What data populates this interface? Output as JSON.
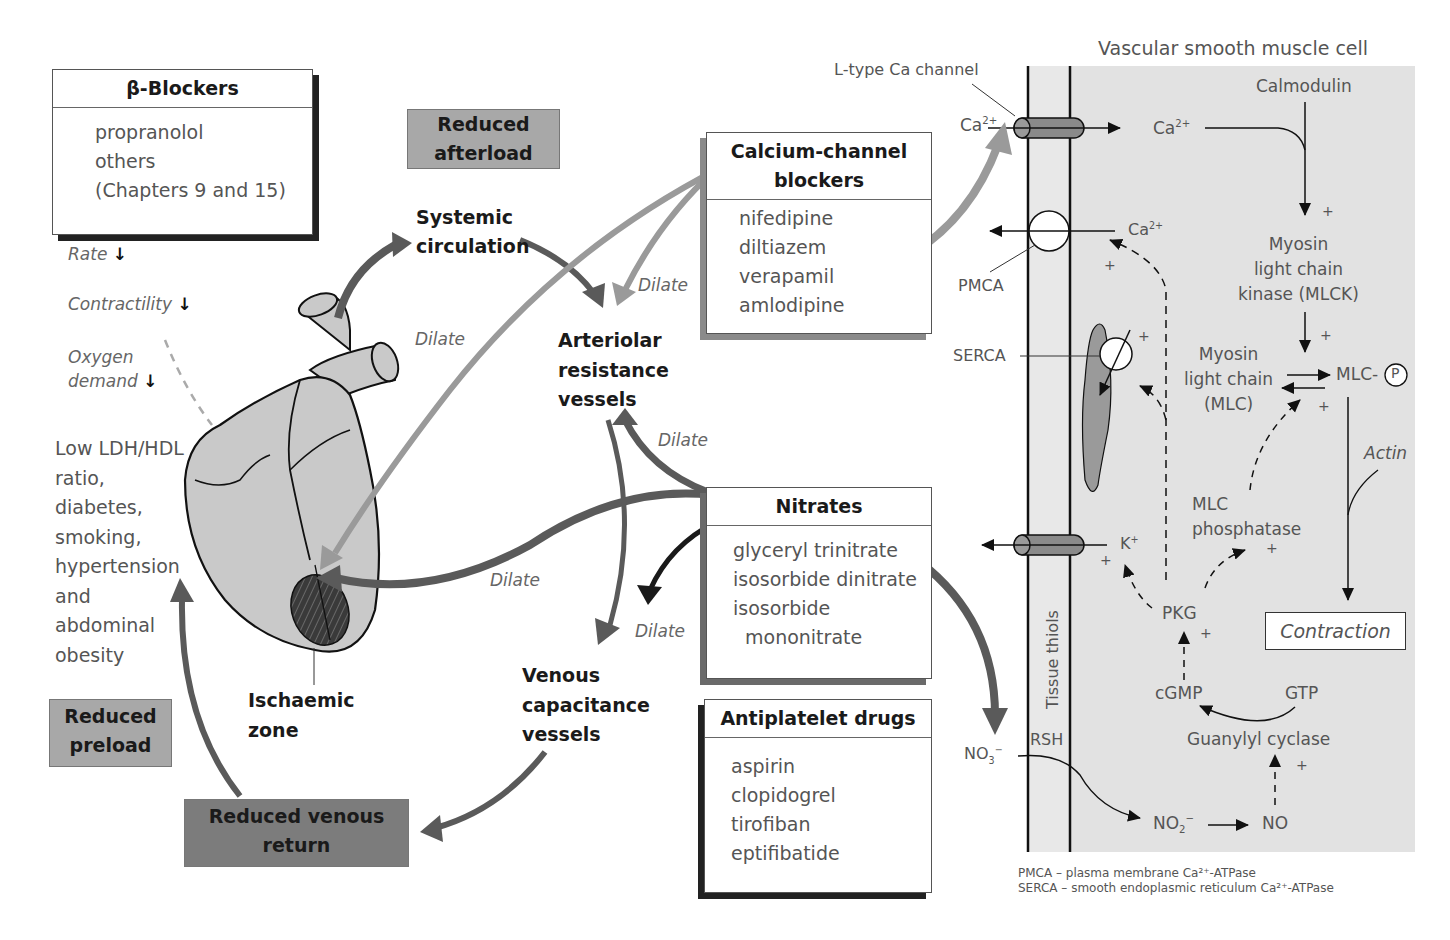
{
  "beta_blockers": {
    "title": "β-Blockers",
    "items": [
      "propranolol",
      "others",
      "(Chapters 9 and 15)"
    ],
    "effects": [
      {
        "label": "Rate",
        "arrow": "↓"
      },
      {
        "label": "Contractility",
        "arrow": "↓"
      },
      {
        "label_line1": "Oxygen",
        "label_line2": "demand",
        "arrow": "↓"
      }
    ]
  },
  "risk_factors": [
    "Low LDH/HDL",
    "ratio,",
    "diabetes,",
    "smoking,",
    "hypertension",
    "and",
    "abdominal",
    "obesity"
  ],
  "effect_boxes": {
    "reduced_afterload": [
      "Reduced",
      "afterload"
    ],
    "reduced_preload": [
      "Reduced",
      "preload"
    ],
    "reduced_venous_return": [
      "Reduced venous",
      "return"
    ]
  },
  "vessels": {
    "systemic_circulation": [
      "Systemic",
      "circulation"
    ],
    "arteriolar": [
      "Arteriolar",
      "resistance",
      "vessels"
    ],
    "venous": [
      "Venous",
      "capacitance",
      "vessels"
    ],
    "ischaemic_zone": [
      "Ischaemic",
      "zone"
    ]
  },
  "dilate_label": "Dilate",
  "calcium_channel_blockers": {
    "title_line1": "Calcium-channel",
    "title_line2": "blockers",
    "items": [
      "nifedipine",
      "diltiazem",
      "verapamil",
      "amlodipine"
    ]
  },
  "nitrates": {
    "title": "Nitrates",
    "items": [
      "glyceryl trinitrate",
      "isosorbide dinitrate",
      "isosorbide",
      "mononitrate"
    ]
  },
  "antiplatelet": {
    "title": "Antiplatelet drugs",
    "items": [
      "aspirin",
      "clopidogrel",
      "tirofiban",
      "eptifibatide"
    ]
  },
  "cell": {
    "title": "Vascular smooth muscle cell",
    "l_type_channel": "L-type Ca channel",
    "ca_out": "Ca",
    "ca_in": "Ca",
    "ca_charge": "2+",
    "calmodulin": "Calmodulin",
    "mlck": [
      "Myosin",
      "light chain",
      "kinase (MLCK)"
    ],
    "mlc": [
      "Myosin",
      "light chain",
      "(MLC)"
    ],
    "mlc_p": "MLC-",
    "p_symbol": "P",
    "pmca": "PMCA",
    "serca": "SERCA",
    "actin": "Actin",
    "k_ion": "K",
    "k_charge": "+",
    "mlc_phosphatase": [
      "MLC",
      "phosphatase"
    ],
    "pkg": "PKG",
    "contraction": "Contraction",
    "tissue_thiols": "Tissue thiols",
    "rsh": "RSH",
    "cgmp": "cGMP",
    "gtp": "GTP",
    "guanylyl_cyclase": "Guanylyl cyclase",
    "no3": "NO",
    "no3_sub": "3",
    "no3_charge": "−",
    "no2": "NO",
    "no2_sub": "2",
    "no2_charge": "−",
    "no": "NO",
    "plus": "+"
  },
  "legend": {
    "pmca": "PMCA – plasma membrane Ca²⁺-ATPase",
    "serca": "SERCA – smooth endoplasmic reticulum Ca²⁺-ATPase"
  },
  "colors": {
    "cell_bg": "#e2e2e2",
    "dark_arrow": "#5a5a5a",
    "light_arrow": "#9a9a9a",
    "reduced_box_light": "#a8a8a8",
    "reduced_box_dark": "#7c7c7c",
    "heart_fill": "#c9c9c9"
  }
}
